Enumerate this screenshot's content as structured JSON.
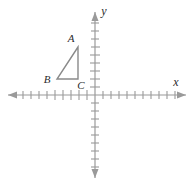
{
  "figure": {
    "name": "coordinate-plane-triangle",
    "background_color": "#ffffff",
    "axis_color": "#9a9a9a",
    "tick_color": "#9a9a9a",
    "shape_color": "#8a8a8a",
    "label_color": "#2b2b2b"
  },
  "axes": {
    "x_label": "x",
    "y_label": "y",
    "origin": {
      "x": 95,
      "y": 95
    },
    "tick_spacing": 8,
    "x_axis": {
      "start_x": 8,
      "end_x": 186,
      "ticks_left_of_origin": 9,
      "ticks_right_of_origin": 10,
      "tick_half_height": 4,
      "arrow_left": true,
      "arrow_right": true
    },
    "y_axis": {
      "start_y": 12,
      "end_y": 178,
      "ticks_above_origin": 9,
      "ticks_below_origin": 9,
      "tick_half_width": 4,
      "arrow_up": true,
      "arrow_down": true
    }
  },
  "triangle": {
    "name": "triangle-ABC",
    "vertices": [
      {
        "label": "A",
        "x": 78,
        "y": 47,
        "label_x": 71,
        "label_y": 42
      },
      {
        "label": "B",
        "x": 57,
        "y": 79,
        "label_x": 47,
        "label_y": 82
      },
      {
        "label": "C",
        "x": 78,
        "y": 79,
        "label_x": 80,
        "label_y": 88
      }
    ],
    "points_path": "78,47 57,79 78,79",
    "closed": true
  },
  "labels": {
    "A": "A",
    "B": "B",
    "C": "C",
    "x": "x",
    "y": "y"
  }
}
